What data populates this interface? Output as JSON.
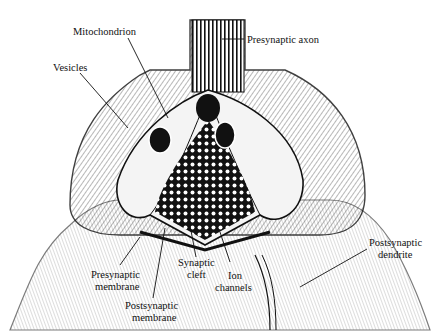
{
  "diagram": {
    "labels": {
      "mitochondrion": "Mitochondrion",
      "presynaptic_axon": "Presynaptic axon",
      "vesicles": "Vesicles",
      "presynaptic_membrane_1": "Presynaptic",
      "presynaptic_membrane_2": "membrane",
      "synaptic_cleft_1": "Synaptic",
      "synaptic_cleft_2": "cleft",
      "ion_channels_1": "Ion",
      "ion_channels_2": "channels",
      "postsynaptic_membrane_1": "Postsynaptic",
      "postsynaptic_membrane_2": "membrane",
      "postsynaptic_dendrite_1": "Postsynaptic",
      "postsynaptic_dendrite_2": "dendrite"
    }
  }
}
